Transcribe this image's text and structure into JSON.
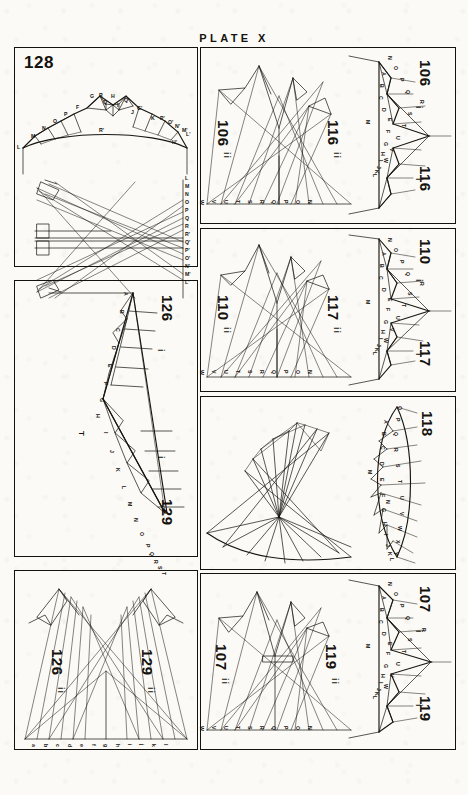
{
  "plate": {
    "title": "PLATE X"
  },
  "panels": [
    {
      "id": "panel-128",
      "number": "128",
      "orientation": "upright",
      "figures": [
        {
          "number": "128",
          "part": "i",
          "kind": "truss",
          "description": "double-pitch braced arch truss"
        },
        {
          "number": "128",
          "part": "ii",
          "kind": "stress",
          "description": "reciprocal stress diagram"
        }
      ],
      "truss_labels": [
        "L",
        "M",
        "N",
        "O",
        "P",
        "F",
        "G",
        "Q",
        "R",
        "H",
        "I",
        "J",
        "K",
        "R'",
        "Q'",
        "G'",
        "P'",
        "O'",
        "N'",
        "M'",
        "L'",
        "H'"
      ],
      "load_line": [
        "L",
        "M",
        "N",
        "O",
        "P",
        "Q",
        "R",
        "R'",
        "Q'",
        "P'",
        "O'",
        "N'",
        "M'",
        "L'"
      ],
      "stress_points": [
        "A",
        "B",
        "C",
        "D",
        "E",
        "F",
        "F'",
        "G",
        "H",
        "I",
        "J",
        "K"
      ]
    },
    {
      "id": "panel-106-116",
      "numbers": [
        "106",
        "116"
      ],
      "parts": [
        "i",
        "ii"
      ],
      "figures": [
        {
          "number": "106",
          "part": "i",
          "kind": "truss"
        },
        {
          "number": "116",
          "part": "i",
          "kind": "truss"
        },
        {
          "number": "106",
          "part": "ii",
          "kind": "stress"
        },
        {
          "number": "116",
          "part": "ii",
          "kind": "stress"
        }
      ],
      "truss_outer": [
        "N",
        "O",
        "P",
        "Q",
        "R",
        "S",
        "T",
        "U",
        "V",
        "W"
      ],
      "truss_inner": [
        "A",
        "B",
        "C",
        "D",
        "E",
        "F",
        "G",
        "H",
        "I",
        "J",
        "K",
        "L",
        "M"
      ],
      "load_line": [
        "W",
        "V",
        "U",
        "T",
        "S",
        "R",
        "Q",
        "P",
        "O",
        "N"
      ],
      "stress_points": [
        "A",
        "B",
        "C",
        "D",
        "E",
        "F",
        "G",
        "H",
        "I",
        "J",
        "K",
        "L",
        "M"
      ]
    },
    {
      "id": "panel-110-117",
      "numbers": [
        "110",
        "117"
      ],
      "parts": [
        "i",
        "ii"
      ],
      "figures": [
        {
          "number": "110",
          "part": "i",
          "kind": "truss"
        },
        {
          "number": "117",
          "part": "i",
          "kind": "truss"
        },
        {
          "number": "110",
          "part": "ii",
          "kind": "stress"
        },
        {
          "number": "117",
          "part": "ii",
          "kind": "stress"
        }
      ],
      "truss_outer": [
        "N",
        "O",
        "P",
        "Q",
        "R",
        "S",
        "T",
        "U",
        "V",
        "W"
      ],
      "truss_inner": [
        "A",
        "B",
        "C",
        "D",
        "E",
        "F",
        "G",
        "H",
        "I",
        "J",
        "K",
        "L",
        "M"
      ],
      "load_line": [
        "W",
        "V",
        "U",
        "T",
        "S",
        "R",
        "Q",
        "P",
        "O",
        "N"
      ],
      "stress_points": [
        "A",
        "B",
        "C",
        "D",
        "E",
        "F",
        "G",
        "H",
        "I",
        "J",
        "K",
        "L",
        "M"
      ]
    },
    {
      "id": "panel-118",
      "numbers": [
        "118"
      ],
      "parts": [
        "i",
        "ii"
      ],
      "figures": [
        {
          "number": "118",
          "part": "i",
          "kind": "truss",
          "description": "lenticular bowstring truss"
        },
        {
          "number": "118",
          "part": "ii",
          "kind": "stress",
          "description": "reciprocal stress diagram"
        }
      ],
      "truss_outer": [
        "O",
        "P",
        "Q",
        "R",
        "S",
        "T",
        "U",
        "V",
        "W",
        "X",
        "Y"
      ],
      "truss_inner": [
        "A",
        "B",
        "C",
        "D",
        "E",
        "F",
        "G",
        "H",
        "I",
        "J",
        "K",
        "L",
        "M",
        "N"
      ],
      "stress_points": [
        "A",
        "B",
        "C",
        "D",
        "E",
        "F",
        "G",
        "H",
        "I",
        "J",
        "K",
        "L",
        "M",
        "N",
        "V",
        "W",
        "X",
        "Y",
        "Z"
      ]
    },
    {
      "id": "panel-107-119",
      "numbers": [
        "107",
        "119"
      ],
      "parts": [
        "i",
        "ii"
      ],
      "figures": [
        {
          "number": "107",
          "part": "i",
          "kind": "truss"
        },
        {
          "number": "119",
          "part": "i",
          "kind": "truss"
        },
        {
          "number": "107",
          "part": "ii",
          "kind": "stress"
        },
        {
          "number": "119",
          "part": "ii",
          "kind": "stress"
        }
      ],
      "truss_outer": [
        "N",
        "O",
        "P",
        "Q",
        "R",
        "S",
        "T",
        "U",
        "V",
        "W"
      ],
      "truss_inner": [
        "A",
        "B",
        "C",
        "D",
        "E",
        "F",
        "G",
        "H",
        "I",
        "J",
        "K",
        "L",
        "M"
      ],
      "load_line": [
        "W",
        "V",
        "U",
        "T",
        "S",
        "R",
        "Q",
        "P",
        "O",
        "N"
      ],
      "stress_points": [
        "A",
        "B",
        "C",
        "D",
        "E",
        "F",
        "G",
        "H",
        "I",
        "J",
        "K",
        "L",
        "M"
      ]
    },
    {
      "id": "panel-126-129",
      "numbers": [
        "126",
        "129"
      ],
      "parts": [
        "i",
        "ii"
      ],
      "figures": [
        {
          "number": "126",
          "part": "i",
          "kind": "truss"
        },
        {
          "number": "129",
          "part": "i",
          "kind": "truss"
        },
        {
          "number": "126",
          "part": "ii",
          "kind": "stress"
        },
        {
          "number": "129",
          "part": "ii",
          "kind": "stress"
        }
      ],
      "truss_outer": [
        "a",
        "b",
        "c",
        "d",
        "e",
        "f",
        "g",
        "h",
        "i",
        "j",
        "k",
        "l"
      ],
      "truss_inner": [
        "A",
        "B",
        "C",
        "D",
        "E",
        "F",
        "G",
        "H",
        "I",
        "J",
        "K",
        "L",
        "M",
        "N",
        "O",
        "P",
        "Q",
        "R",
        "S",
        "T"
      ],
      "load_line": [
        "a",
        "b",
        "c",
        "d",
        "e",
        "f",
        "g",
        "h",
        "i",
        "j",
        "k",
        "l"
      ],
      "center_label": "T"
    }
  ],
  "colors": {
    "ink": "#18160f",
    "paper": "#fbfaf6"
  }
}
